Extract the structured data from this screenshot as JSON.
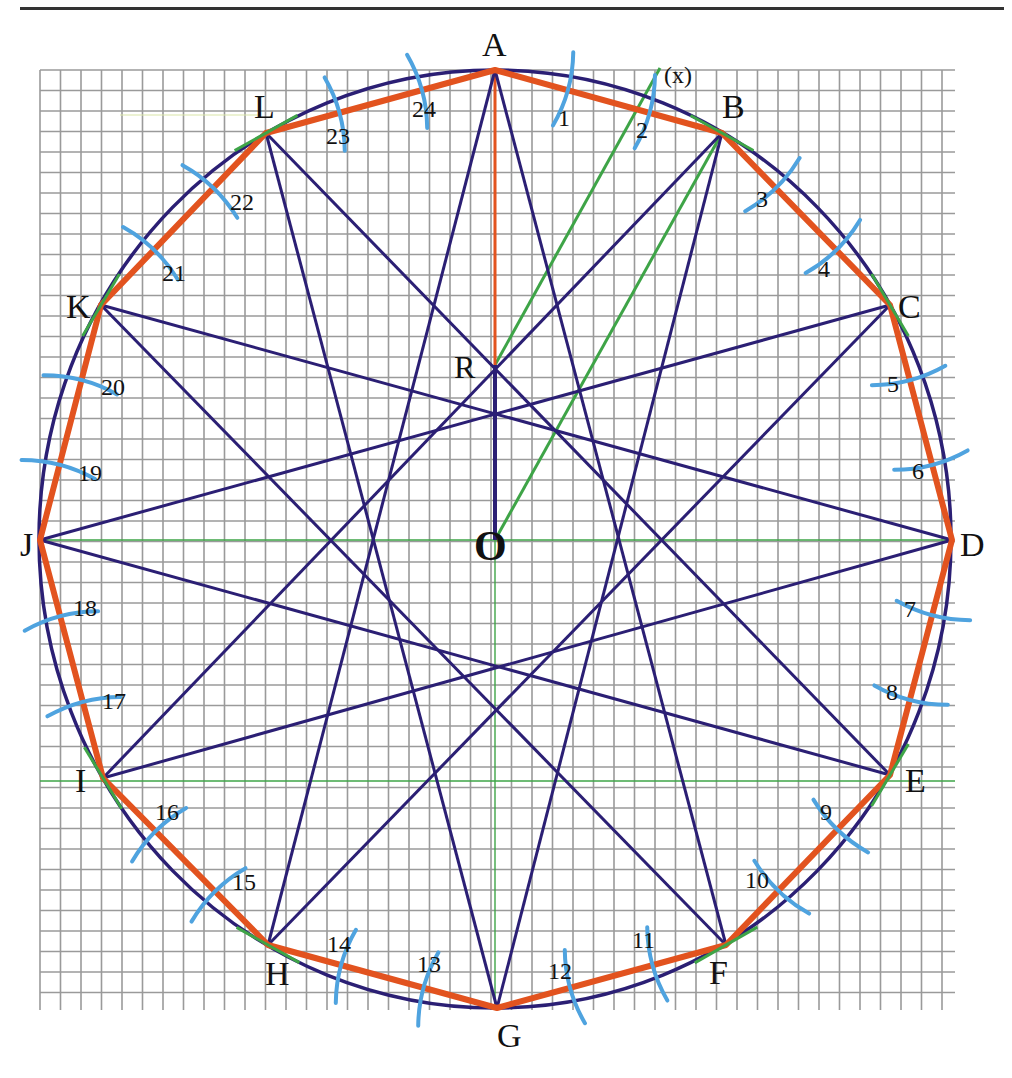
{
  "figure": {
    "colors": {
      "grid": "#9a9a9a",
      "circle": "#2b1f74",
      "star": "#2b1f74",
      "polygon": "#e2531f",
      "construction": "#3ea447",
      "arcs": "#4fa3df",
      "text": "#111111",
      "rule": "#333333"
    },
    "grid": {
      "x0": 40,
      "y0": 70,
      "x1": 955,
      "y1": 1010,
      "cell": 20.5
    },
    "center": {
      "label": "O",
      "x": 495,
      "y": 540
    },
    "point_R": {
      "label": "R",
      "x": 495,
      "y": 365
    },
    "axis_labels": {
      "x_marker": "(x)"
    },
    "vertices": [
      {
        "label": "A",
        "x": 495,
        "y": 70,
        "lx": 482,
        "ly": 56
      },
      {
        "label": "B",
        "x": 722,
        "y": 133,
        "lx": 722,
        "ly": 118
      },
      {
        "label": "C",
        "x": 890,
        "y": 305,
        "lx": 898,
        "ly": 318
      },
      {
        "label": "D",
        "x": 952,
        "y": 540,
        "lx": 960,
        "ly": 556
      },
      {
        "label": "E",
        "x": 890,
        "y": 775,
        "lx": 905,
        "ly": 792
      },
      {
        "label": "F",
        "x": 726,
        "y": 945,
        "lx": 709,
        "ly": 984
      },
      {
        "label": "G",
        "x": 497,
        "y": 1008,
        "lx": 497,
        "ly": 1047
      },
      {
        "label": "H",
        "x": 268,
        "y": 945,
        "lx": 265,
        "ly": 985
      },
      {
        "label": "I",
        "x": 103,
        "y": 778,
        "lx": 75,
        "ly": 792
      },
      {
        "label": "J",
        "x": 40,
        "y": 540,
        "lx": 20,
        "ly": 556
      },
      {
        "label": "K",
        "x": 101,
        "y": 305,
        "lx": 66,
        "ly": 318
      },
      {
        "label": "L",
        "x": 266,
        "y": 133,
        "lx": 254,
        "ly": 118
      }
    ],
    "arc_marks": [
      {
        "n": "1",
        "lx": 558,
        "ly": 126
      },
      {
        "n": "2",
        "lx": 636,
        "ly": 138
      },
      {
        "n": "3",
        "lx": 756,
        "ly": 207
      },
      {
        "n": "4",
        "lx": 818,
        "ly": 277
      },
      {
        "n": "5",
        "lx": 887,
        "ly": 392
      },
      {
        "n": "6",
        "lx": 912,
        "ly": 479
      },
      {
        "n": "7",
        "lx": 904,
        "ly": 617
      },
      {
        "n": "8",
        "lx": 886,
        "ly": 700
      },
      {
        "n": "9",
        "lx": 820,
        "ly": 820
      },
      {
        "n": "10",
        "lx": 745,
        "ly": 888
      },
      {
        "n": "11",
        "lx": 632,
        "ly": 948
      },
      {
        "n": "12",
        "lx": 548,
        "ly": 979
      },
      {
        "n": "13",
        "lx": 417,
        "ly": 972
      },
      {
        "n": "14",
        "lx": 327,
        "ly": 952
      },
      {
        "n": "15",
        "lx": 232,
        "ly": 890
      },
      {
        "n": "16",
        "lx": 155,
        "ly": 820
      },
      {
        "n": "17",
        "lx": 102,
        "ly": 709
      },
      {
        "n": "18",
        "lx": 73,
        "ly": 616
      },
      {
        "n": "19",
        "lx": 78,
        "ly": 481
      },
      {
        "n": "20",
        "lx": 101,
        "ly": 395
      },
      {
        "n": "21",
        "lx": 162,
        "ly": 281
      },
      {
        "n": "22",
        "lx": 230,
        "ly": 210
      },
      {
        "n": "23",
        "lx": 326,
        "ly": 144
      },
      {
        "n": "24",
        "lx": 412,
        "ly": 117
      }
    ]
  }
}
